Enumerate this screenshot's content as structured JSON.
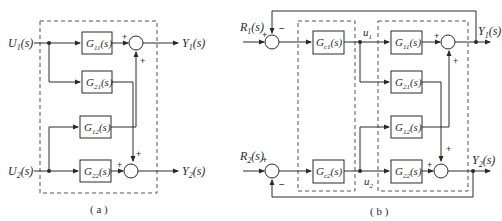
{
  "diagram_a": {
    "caption": "( a )",
    "inputs": [
      {
        "main": "U",
        "sub": "1",
        "arg": "(s)"
      },
      {
        "main": "U",
        "sub": "2",
        "arg": "(s)"
      }
    ],
    "outputs": [
      {
        "main": "Y",
        "sub": "1",
        "arg": "(s)"
      },
      {
        "main": "Y",
        "sub": "2",
        "arg": "(s)"
      }
    ],
    "blocks": [
      {
        "main": "G",
        "sub": "11",
        "arg": "(s)"
      },
      {
        "main": "G",
        "sub": "21",
        "arg": "(s)"
      },
      {
        "main": "G",
        "sub": "12",
        "arg": "(s)"
      },
      {
        "main": "G",
        "sub": "22",
        "arg": "(s)"
      }
    ],
    "signs": {
      "top_left": "+",
      "top_bottom": "+",
      "bottom_left": "+",
      "bottom_top": "+"
    }
  },
  "diagram_b": {
    "caption": "( b )",
    "references": [
      {
        "main": "R",
        "sub": "1",
        "arg": "(s)"
      },
      {
        "main": "R",
        "sub": "2",
        "arg": "(s)"
      }
    ],
    "outputs": [
      {
        "main": "Y",
        "sub": "1",
        "arg": "(s)"
      },
      {
        "main": "Y",
        "sub": "2",
        "arg": "(s)"
      }
    ],
    "controllers": [
      {
        "main": "G",
        "sub": "c1",
        "arg": "(s)"
      },
      {
        "main": "G",
        "sub": "c2",
        "arg": "(s)"
      }
    ],
    "signals": [
      {
        "main": "u",
        "sub": "1"
      },
      {
        "main": "u",
        "sub": "2"
      }
    ],
    "blocks": [
      {
        "main": "G",
        "sub": "11",
        "arg": "(s)"
      },
      {
        "main": "G",
        "sub": "21",
        "arg": "(s)"
      },
      {
        "main": "G",
        "sub": "12",
        "arg": "(s)"
      },
      {
        "main": "G",
        "sub": "22",
        "arg": "(s)"
      }
    ],
    "signs": {
      "sum1_ref": "+",
      "sum1_fb": "−",
      "sum2_ref": "+",
      "sum2_fb": "−",
      "out1_left": "+",
      "out1_bottom": "+",
      "out2_left": "+",
      "out2_top": "+"
    }
  },
  "colors": {
    "line": "#2a2a2a",
    "dashed": "#555555",
    "background": "#ffffff"
  }
}
